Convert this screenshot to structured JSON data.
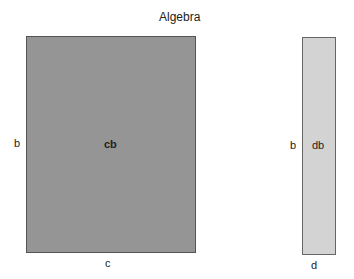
{
  "title": "Algebra",
  "shapes": {
    "big": {
      "inner_label": "cb",
      "side_label": "b",
      "bottom_label": "c",
      "fill": "#959595"
    },
    "small": {
      "inner_label": "db",
      "side_label": "b",
      "bottom_label": "d",
      "fill": "#d3d3d3"
    }
  }
}
